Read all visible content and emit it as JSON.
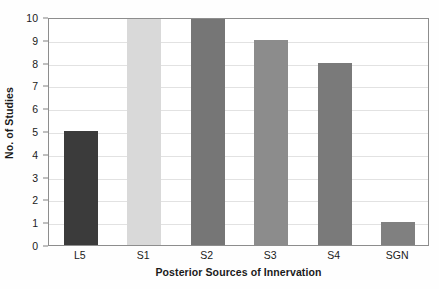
{
  "chart_data": {
    "type": "bar",
    "title": "",
    "subtitle": "",
    "xlabel": "Posterior Sources of Innervation",
    "ylabel": "No. of Studies",
    "categories": [
      "L5",
      "S1",
      "S2",
      "S3",
      "S4",
      "SGN"
    ],
    "values": [
      5,
      10,
      10,
      9,
      8,
      1
    ],
    "series": [
      {
        "name": "No. of Studies",
        "values": [
          5,
          10,
          10,
          9,
          8,
          1
        ]
      }
    ],
    "bar_colors": [
      "#3b3b3b",
      "#d9d9d9",
      "#767676",
      "#8c8c8c",
      "#7a7a7a",
      "#808080"
    ],
    "ylim": [
      0,
      10
    ],
    "ytick_labels": [
      "0",
      "1",
      "2",
      "3",
      "4",
      "5",
      "6",
      "7",
      "8",
      "9",
      "10"
    ],
    "ytick_values": [
      0,
      1,
      2,
      3,
      4,
      5,
      6,
      7,
      8,
      9,
      10
    ],
    "grid": "horizontal",
    "legend": "none",
    "legend_position": "none",
    "plot_background": "#ffffff",
    "grid_color": "#e2e2e2",
    "axis_color": "#8d8d8d",
    "text_color": "#1a1a1a"
  }
}
